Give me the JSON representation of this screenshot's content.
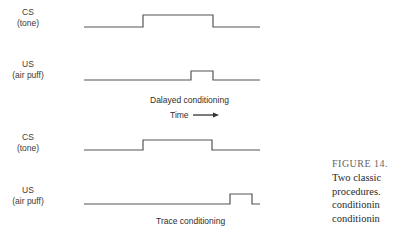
{
  "diagram": {
    "panels": [
      {
        "name": "delayed",
        "caption": "Dalayed conditioning",
        "cs": {
          "label": "CS",
          "sublabel": "(tone)"
        },
        "us": {
          "label": "US",
          "sublabel": "(air puff)"
        }
      },
      {
        "name": "trace",
        "caption": "Trace conditioning",
        "cs": {
          "label": "CS",
          "sublabel": "(tone)"
        },
        "us": {
          "label": "US",
          "sublabel": "(air puff)"
        }
      }
    ],
    "time_label": "Time",
    "time_arrow_icon": "right-arrow",
    "line_color": "#555555"
  },
  "figure_caption": {
    "title": "FIGURE 14.",
    "lines": [
      "Two classic",
      "procedures.",
      "conditionin",
      "conditionin"
    ]
  }
}
